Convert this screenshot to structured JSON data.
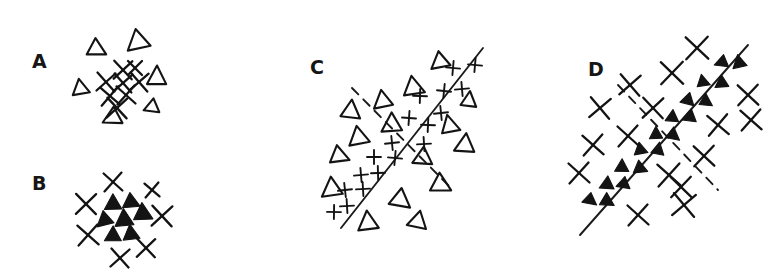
{
  "figure": {
    "background_color": "#ffffff",
    "ink_color": "#141414",
    "width": 781,
    "height": 279
  },
  "panels": [
    {
      "id": "A",
      "label": "A",
      "label_x": 32,
      "label_y": 68,
      "description": "X markers clustered at center, open triangles scattered around the periphery",
      "center_class": "x-mark",
      "outer_class": "triangle",
      "has_boundary": false
    },
    {
      "id": "B",
      "label": "B",
      "label_x": 32,
      "label_y": 190,
      "description": "Filled triangles clustered at center, X markers scattered around the periphery",
      "center_class": "triangle",
      "outer_class": "x-mark",
      "has_boundary": false
    },
    {
      "id": "C",
      "label": "C",
      "label_x": 310,
      "label_y": 74,
      "description": "Plus markers aligned along a solid diagonal boundary, open triangles spread on both sides; a dashed perpendicular boundary crosses it",
      "center_class": "plus",
      "outer_class": "triangle",
      "has_boundary": true,
      "solid_line_label": "solid-boundary",
      "dashed_line_label": "dashed-boundary"
    },
    {
      "id": "D",
      "label": "D",
      "label_x": 588,
      "label_y": 76,
      "description": "Small filled triangles aligned along a solid diagonal boundary, X markers spread on both sides; a dashed perpendicular boundary crosses it",
      "center_class": "triangle",
      "outer_class": "x-mark",
      "has_boundary": true,
      "solid_line_label": "solid-boundary",
      "dashed_line_label": "dashed-boundary"
    }
  ],
  "chart_data": {
    "type": "scatter",
    "subtitle": "",
    "xlabel": "",
    "ylabel": "",
    "grid": false,
    "legend_position": "none",
    "legend": [
      {
        "name": "triangle",
        "glyph": "triangle"
      },
      {
        "name": "x-mark",
        "glyph": "x"
      },
      {
        "name": "plus",
        "glyph": "plus"
      }
    ],
    "panels": [
      {
        "id": "A",
        "label": "A",
        "series": [
          {
            "name": "x-mark",
            "glyph": "x",
            "points": [
              {
                "x": 123,
                "y": 70,
                "s": 9
              },
              {
                "x": 106,
                "y": 82,
                "s": 9
              },
              {
                "x": 123,
                "y": 83,
                "s": 9
              },
              {
                "x": 139,
                "y": 82,
                "s": 9
              },
              {
                "x": 110,
                "y": 96,
                "s": 9
              },
              {
                "x": 126,
                "y": 95,
                "s": 9
              },
              {
                "x": 117,
                "y": 108,
                "s": 10
              },
              {
                "x": 135,
                "y": 68,
                "s": 7
              }
            ]
          },
          {
            "name": "triangle",
            "glyph": "triangle",
            "points": [
              {
                "x": 96,
                "y": 49,
                "s": 11
              },
              {
                "x": 138,
                "y": 42,
                "s": 13
              },
              {
                "x": 80,
                "y": 89,
                "s": 10
              },
              {
                "x": 157,
                "y": 78,
                "s": 12
              },
              {
                "x": 152,
                "y": 107,
                "s": 9
              },
              {
                "x": 113,
                "y": 117,
                "s": 11
              }
            ]
          }
        ]
      },
      {
        "id": "B",
        "label": "B",
        "series": [
          {
            "name": "triangle",
            "glyph": "triangle-filled",
            "points": [
              {
                "x": 113,
                "y": 204,
                "s": 10
              },
              {
                "x": 131,
                "y": 202,
                "s": 10
              },
              {
                "x": 105,
                "y": 220,
                "s": 10
              },
              {
                "x": 124,
                "y": 220,
                "s": 11
              },
              {
                "x": 143,
                "y": 214,
                "s": 11
              },
              {
                "x": 113,
                "y": 236,
                "s": 10
              },
              {
                "x": 131,
                "y": 234,
                "s": 10
              }
            ]
          },
          {
            "name": "x-mark",
            "glyph": "x",
            "points": [
              {
                "x": 113,
                "y": 182,
                "s": 9
              },
              {
                "x": 152,
                "y": 190,
                "s": 7
              },
              {
                "x": 86,
                "y": 204,
                "s": 10
              },
              {
                "x": 162,
                "y": 216,
                "s": 10
              },
              {
                "x": 88,
                "y": 235,
                "s": 10
              },
              {
                "x": 146,
                "y": 248,
                "s": 9
              },
              {
                "x": 120,
                "y": 258,
                "s": 9
              }
            ]
          }
        ]
      },
      {
        "id": "C",
        "label": "C",
        "boundaries": [
          {
            "type": "solid",
            "x1": 341,
            "y1": 228,
            "x2": 483,
            "y2": 48
          },
          {
            "type": "dashed",
            "x1": 352,
            "y1": 88,
            "x2": 452,
            "y2": 189
          }
        ],
        "series": [
          {
            "name": "plus",
            "glyph": "plus",
            "points": [
              {
                "x": 453,
                "y": 68,
                "s": 7
              },
              {
                "x": 475,
                "y": 65,
                "s": 7
              },
              {
                "x": 444,
                "y": 91,
                "s": 7
              },
              {
                "x": 462,
                "y": 89,
                "s": 7
              },
              {
                "x": 420,
                "y": 96,
                "s": 7
              },
              {
                "x": 441,
                "y": 113,
                "s": 7
              },
              {
                "x": 409,
                "y": 118,
                "s": 7
              },
              {
                "x": 428,
                "y": 125,
                "s": 7
              },
              {
                "x": 424,
                "y": 144,
                "s": 7
              },
              {
                "x": 392,
                "y": 143,
                "s": 7
              },
              {
                "x": 395,
                "y": 158,
                "s": 7
              },
              {
                "x": 374,
                "y": 157,
                "s": 7
              },
              {
                "x": 378,
                "y": 173,
                "s": 7
              },
              {
                "x": 361,
                "y": 175,
                "s": 7
              },
              {
                "x": 363,
                "y": 189,
                "s": 7
              },
              {
                "x": 345,
                "y": 190,
                "s": 7
              },
              {
                "x": 347,
                "y": 206,
                "s": 7
              },
              {
                "x": 334,
                "y": 212,
                "s": 7
              }
            ]
          },
          {
            "name": "triangle",
            "glyph": "triangle",
            "points": [
              {
                "x": 440,
                "y": 62,
                "s": 11
              },
              {
                "x": 413,
                "y": 88,
                "s": 12
              },
              {
                "x": 383,
                "y": 101,
                "s": 11
              },
              {
                "x": 351,
                "y": 112,
                "s": 12
              },
              {
                "x": 469,
                "y": 101,
                "s": 10
              },
              {
                "x": 450,
                "y": 126,
                "s": 11
              },
              {
                "x": 392,
                "y": 125,
                "s": 12
              },
              {
                "x": 359,
                "y": 138,
                "s": 12
              },
              {
                "x": 339,
                "y": 156,
                "s": 11
              },
              {
                "x": 465,
                "y": 145,
                "s": 12
              },
              {
                "x": 423,
                "y": 158,
                "s": 11
              },
              {
                "x": 440,
                "y": 185,
                "s": 12
              },
              {
                "x": 332,
                "y": 189,
                "s": 12
              },
              {
                "x": 400,
                "y": 200,
                "s": 12
              },
              {
                "x": 418,
                "y": 221,
                "s": 11
              },
              {
                "x": 368,
                "y": 223,
                "s": 12
              }
            ]
          }
        ]
      },
      {
        "id": "D",
        "label": "D",
        "boundaries": [
          {
            "type": "solid",
            "x1": 580,
            "y1": 235,
            "x2": 748,
            "y2": 45
          },
          {
            "type": "dashed",
            "x1": 618,
            "y1": 85,
            "x2": 718,
            "y2": 190
          }
        ],
        "series": [
          {
            "name": "triangle",
            "glyph": "triangle-filled",
            "points": [
              {
                "x": 722,
                "y": 62,
                "s": 8
              },
              {
                "x": 739,
                "y": 63,
                "s": 8
              },
              {
                "x": 703,
                "y": 82,
                "s": 8
              },
              {
                "x": 722,
                "y": 83,
                "s": 8
              },
              {
                "x": 688,
                "y": 100,
                "s": 8
              },
              {
                "x": 706,
                "y": 101,
                "s": 8
              },
              {
                "x": 672,
                "y": 117,
                "s": 8
              },
              {
                "x": 690,
                "y": 117,
                "s": 8
              },
              {
                "x": 656,
                "y": 134,
                "s": 8
              },
              {
                "x": 673,
                "y": 135,
                "s": 8
              },
              {
                "x": 640,
                "y": 150,
                "s": 8
              },
              {
                "x": 658,
                "y": 150,
                "s": 8
              },
              {
                "x": 622,
                "y": 167,
                "s": 8
              },
              {
                "x": 640,
                "y": 168,
                "s": 8
              },
              {
                "x": 607,
                "y": 184,
                "s": 8
              },
              {
                "x": 624,
                "y": 184,
                "s": 8
              },
              {
                "x": 590,
                "y": 200,
                "s": 8
              },
              {
                "x": 607,
                "y": 201,
                "s": 8
              }
            ]
          },
          {
            "name": "x-mark",
            "glyph": "x",
            "points": [
              {
                "x": 697,
                "y": 48,
                "s": 11
              },
              {
                "x": 672,
                "y": 73,
                "s": 11
              },
              {
                "x": 630,
                "y": 85,
                "s": 10
              },
              {
                "x": 600,
                "y": 108,
                "s": 10
              },
              {
                "x": 653,
                "y": 108,
                "s": 10
              },
              {
                "x": 748,
                "y": 95,
                "s": 10
              },
              {
                "x": 751,
                "y": 120,
                "s": 10
              },
              {
                "x": 718,
                "y": 125,
                "s": 10
              },
              {
                "x": 628,
                "y": 136,
                "s": 10
              },
              {
                "x": 593,
                "y": 145,
                "s": 10
              },
              {
                "x": 704,
                "y": 156,
                "s": 10
              },
              {
                "x": 579,
                "y": 173,
                "s": 10
              },
              {
                "x": 669,
                "y": 175,
                "s": 11
              },
              {
                "x": 684,
                "y": 205,
                "s": 11
              },
              {
                "x": 638,
                "y": 215,
                "s": 10
              },
              {
                "x": 681,
                "y": 187,
                "s": 10
              }
            ]
          }
        ]
      }
    ]
  }
}
